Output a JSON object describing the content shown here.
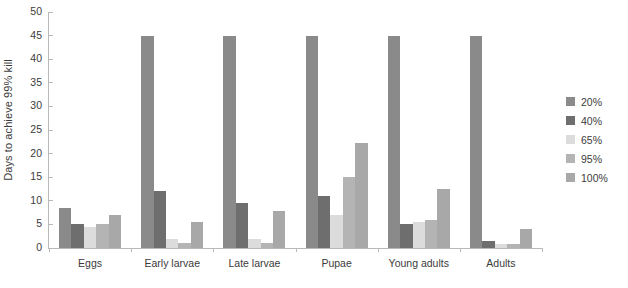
{
  "chart_data": {
    "type": "bar",
    "title": "",
    "subtitle": "",
    "xlabel": "",
    "ylabel": "Days to achieve 99% kill",
    "ylim": [
      0,
      50
    ],
    "yticks": [
      0,
      5,
      10,
      15,
      20,
      25,
      30,
      35,
      40,
      45,
      50
    ],
    "grid": false,
    "legend_position": "right",
    "categories": [
      "Eggs",
      "Early larvae",
      "Late larvae",
      "Pupae",
      "Young adults",
      "Adults"
    ],
    "series": [
      {
        "name": "20%",
        "color": "#8a8a8a",
        "values": [
          8.5,
          45,
          45,
          45,
          45,
          45
        ]
      },
      {
        "name": "40%",
        "color": "#6e6e6e",
        "values": [
          5,
          12,
          9.5,
          11,
          5,
          1.5
        ]
      },
      {
        "name": "65%",
        "color": "#dcdcdc",
        "values": [
          4.5,
          2,
          2,
          7,
          5.5,
          0.8
        ]
      },
      {
        "name": "95%",
        "color": "#b4b4b4",
        "values": [
          5,
          1,
          1,
          15,
          6,
          0.8
        ]
      },
      {
        "name": "100%",
        "color": "#a8a8a8",
        "values": [
          7,
          5.5,
          7.8,
          22.3,
          12.5,
          4
        ]
      }
    ],
    "axis_color": "#b9b9b9",
    "text_color": "#3b3b3b",
    "background": "#ffffff"
  }
}
